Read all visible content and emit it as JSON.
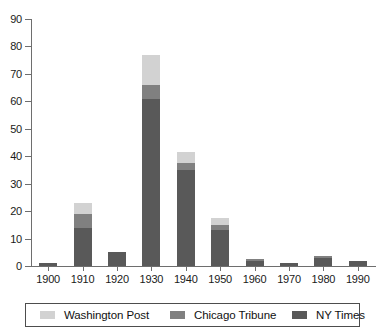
{
  "chart_data": {
    "type": "bar",
    "subtype": "stacked-bar",
    "title": "",
    "xlabel": "",
    "ylabel": "",
    "categories": [
      "1900",
      "1910",
      "1920",
      "1930",
      "1940",
      "1950",
      "1960",
      "1970",
      "1980",
      "1990"
    ],
    "series": [
      {
        "name": "NY Times",
        "color": "#595959",
        "values": [
          1,
          14,
          5,
          61,
          35,
          13,
          2,
          1,
          3,
          2
        ]
      },
      {
        "name": "Chicago Tribune",
        "color": "#808080",
        "values": [
          0,
          5,
          0,
          5,
          2.5,
          2,
          0.5,
          0,
          0.5,
          0
        ]
      },
      {
        "name": "Washington Post",
        "color": "#d2d2d2",
        "values": [
          0,
          4,
          0,
          11,
          4,
          2.5,
          0,
          0,
          0,
          0
        ]
      }
    ],
    "stack_order_bottom_to_top": [
      "NY Times",
      "Chicago Tribune",
      "Washington Post"
    ],
    "totals": [
      1,
      23,
      5,
      77,
      41.5,
      17.5,
      2.5,
      1,
      3.5,
      2
    ],
    "ylim": [
      0,
      90
    ],
    "ytick_values": [
      0,
      10,
      20,
      30,
      40,
      50,
      60,
      70,
      80,
      90
    ],
    "ytick_labels": [
      "0",
      "10",
      "20",
      "30",
      "40",
      "50",
      "60",
      "70",
      "80",
      "90"
    ],
    "xtick_labels": [
      "1900",
      "1910",
      "1920",
      "1930",
      "1940",
      "1950",
      "1960",
      "1970",
      "1980",
      "1990"
    ],
    "grid": false,
    "legend_position": "bottom",
    "legend": [
      {
        "label": "Washington Post",
        "color": "#d2d2d2"
      },
      {
        "label": "Chicago Tribune",
        "color": "#808080"
      },
      {
        "label": "NY Times",
        "color": "#595959"
      }
    ]
  }
}
